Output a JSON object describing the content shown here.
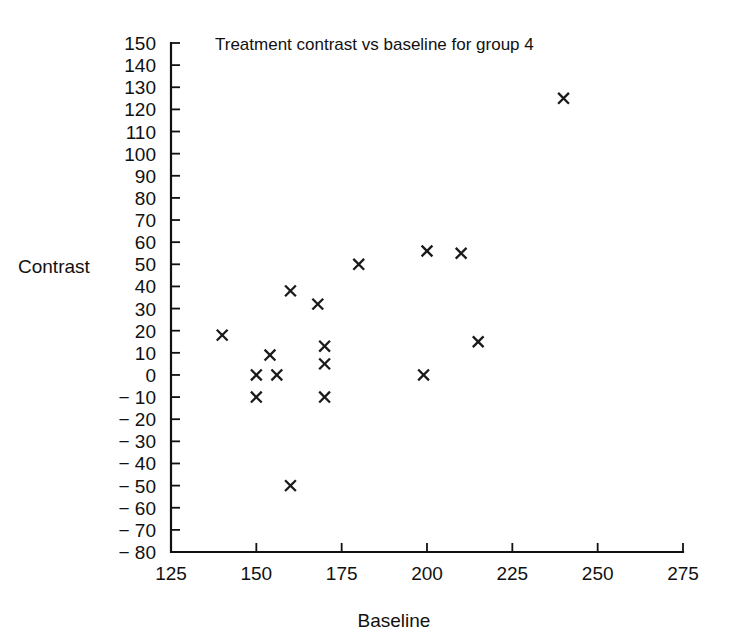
{
  "chart_data": {
    "type": "scatter",
    "title": "Treatment contrast vs baseline for group 4",
    "xlabel": "Baseline",
    "ylabel": "Contrast",
    "xlim": [
      125,
      275
    ],
    "ylim": [
      -80,
      150
    ],
    "xticks": [
      125,
      150,
      175,
      200,
      225,
      250,
      275
    ],
    "xtick_labels": [
      "125",
      "150",
      "175",
      "200",
      "225",
      "250",
      "275"
    ],
    "yticks": [
      -80,
      -70,
      -60,
      -50,
      -40,
      -30,
      -20,
      -10,
      0,
      10,
      20,
      30,
      40,
      50,
      60,
      70,
      80,
      90,
      100,
      110,
      120,
      130,
      140,
      150
    ],
    "ytick_labels": [
      "− 80",
      "− 70",
      "− 60",
      "− 50",
      "− 40",
      "− 30",
      "− 20",
      "− 10",
      "0",
      "10",
      "20",
      "30",
      "40",
      "50",
      "60",
      "70",
      "80",
      "90",
      "100",
      "110",
      "120",
      "130",
      "140",
      "150"
    ],
    "grid": false,
    "legend": null,
    "marker": "x",
    "marker_color": "#1a1a1a",
    "points": [
      {
        "x": 140,
        "y": 18
      },
      {
        "x": 150,
        "y": 0
      },
      {
        "x": 150,
        "y": -10
      },
      {
        "x": 154,
        "y": 9
      },
      {
        "x": 156,
        "y": 0
      },
      {
        "x": 160,
        "y": 38
      },
      {
        "x": 160,
        "y": -50
      },
      {
        "x": 168,
        "y": 32
      },
      {
        "x": 170,
        "y": 13
      },
      {
        "x": 170,
        "y": 5
      },
      {
        "x": 170,
        "y": -10
      },
      {
        "x": 180,
        "y": 50
      },
      {
        "x": 199,
        "y": 0
      },
      {
        "x": 200,
        "y": 56
      },
      {
        "x": 210,
        "y": 55
      },
      {
        "x": 215,
        "y": 15
      },
      {
        "x": 240,
        "y": 125
      }
    ]
  },
  "axes": {
    "y_axis_name": "contrast-axis",
    "x_axis_name": "baseline-axis"
  }
}
